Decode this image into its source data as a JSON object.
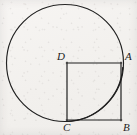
{
  "figure": {
    "type": "geometry-diagram",
    "background_color": "#f4f2f0",
    "stroke_color": "#1b1b1b",
    "canvas": {
      "width": 137,
      "height": 135
    },
    "circle": {
      "cx": 65,
      "cy": 63,
      "r": 58.5,
      "stroke_width": 1.1
    },
    "square": {
      "left": 67,
      "top": 63,
      "right": 121,
      "bottom": 120,
      "stroke_width": 1.2
    },
    "arc": {
      "from": {
        "x": 121,
        "y": 63
      },
      "to": {
        "x": 65,
        "y": 121.5
      },
      "description": "quarter arc of circle from A down to bottom of circle"
    },
    "points": [
      {
        "id": "D",
        "label": "D",
        "x": 67,
        "y": 63,
        "label_x": 57,
        "label_y": 51
      },
      {
        "id": "A",
        "label": "A",
        "x": 121,
        "y": 63,
        "label_x": 125,
        "label_y": 51
      },
      {
        "id": "B",
        "label": "B",
        "x": 121,
        "y": 120,
        "label_x": 123,
        "label_y": 122
      },
      {
        "id": "C",
        "label": "C",
        "x": 67,
        "y": 120,
        "label_x": 63,
        "label_y": 122
      }
    ],
    "segments": [
      {
        "name": "DA",
        "from": "D",
        "to": "A"
      },
      {
        "name": "AB",
        "from": "A",
        "to": "B"
      },
      {
        "name": "BC",
        "from": "B",
        "to": "C"
      },
      {
        "name": "CD",
        "from": "C",
        "to": "D"
      }
    ]
  }
}
